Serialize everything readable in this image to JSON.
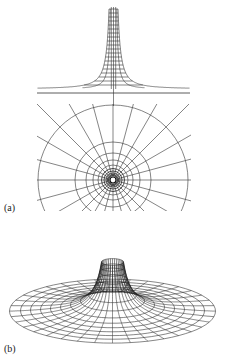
{
  "figure": {
    "panels": [
      {
        "label": "(a)",
        "content": "profile and polar grid"
      },
      {
        "label": "(b)",
        "content": "3D wireframe embedding surface"
      }
    ],
    "colors": {
      "line": "#222222",
      "background": "#ffffff"
    }
  }
}
